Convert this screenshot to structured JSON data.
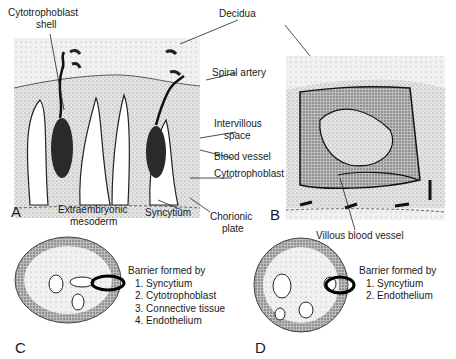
{
  "figure": {
    "panels": {
      "A": {
        "letter": "A"
      },
      "B": {
        "letter": "B"
      },
      "C": {
        "letter": "C"
      },
      "D": {
        "letter": "D"
      }
    },
    "labels": {
      "cytotrophoblast_shell_1": "Cytotrophoblast",
      "cytotrophoblast_shell_2": "shell",
      "decidua": "Decidua",
      "spiral_artery": "Spiral artery",
      "intervillous_space_1": "Intervillous",
      "intervillous_space_2": "space",
      "blood_vessel": "Blood vessel",
      "cytotrophoblast": "Cytotrophoblast",
      "extraembryonic_mesoderm_1": "Extraembryonic",
      "extraembryonic_mesoderm_2": "mesoderm",
      "syncytium": "Syncytium",
      "chorionic_plate_1": "Chorionic",
      "chorionic_plate_2": "plate",
      "villous_blood_vessel": "Villous blood vessel"
    },
    "barrier_C": {
      "title": "Barrier formed by",
      "items": [
        "1. Syncytium",
        "2. Cytotrophoblast",
        "3. Connective tissue",
        "4. Endothelium"
      ]
    },
    "barrier_D": {
      "title": "Barrier formed by",
      "items": [
        "1. Syncytium",
        "2. Endothelium"
      ]
    }
  }
}
